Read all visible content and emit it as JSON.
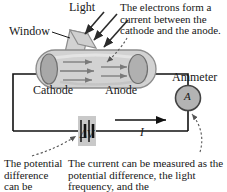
{
  "figure": {
    "labels": {
      "light": "Light",
      "window": "Window",
      "cathode": "Cathode",
      "anode": "Anode",
      "ammeter": "Ammeter",
      "ammeter_symbol": "A",
      "potential_difference": "ΔV",
      "current": "I"
    },
    "annotations": {
      "electrons": "The electrons form a current between the cathode and the anode.",
      "potential": "The potential difference can be changed or",
      "current": "The current can be measured as the potential difference, the light frequency, and the"
    },
    "colors": {
      "ink": "#171717",
      "tube_fill": "#d2d2d2",
      "tube_stroke": "#8c8c8c",
      "electrode_fill": "#a8a8a8",
      "electrode_stroke": "#6e6e6e",
      "wire": "#111111",
      "electron_arrow": "#7a7a7a",
      "light_arrow": "#2b2b2b",
      "background": "#ffffff"
    }
  }
}
